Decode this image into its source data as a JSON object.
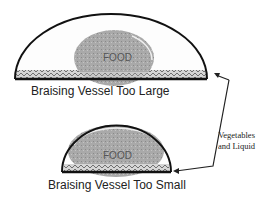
{
  "diagrams": [
    {
      "id": "large",
      "food_label": "FOOD",
      "caption": "Braising Vessel Too Large"
    },
    {
      "id": "small",
      "food_label": "FOOD",
      "caption": "Braising Vessel Too Small"
    }
  ],
  "annotation": {
    "line1": "Vegetables",
    "line2": "and Liquid"
  },
  "colors": {
    "outline": "#111111",
    "food": "#a8a8a8",
    "liquid": "#cfcfcf"
  }
}
